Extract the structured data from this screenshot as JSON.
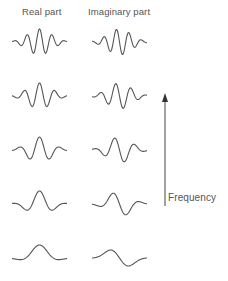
{
  "headers": {
    "real": "Real part",
    "imaginary": "Imaginary part"
  },
  "axis": {
    "label": "Frequency",
    "direction": "up"
  },
  "rows": [
    {
      "center_y": 42,
      "cycles": 2.2,
      "sigma": 0.42
    },
    {
      "center_y": 96,
      "cycles": 1.8,
      "sigma": 0.42
    },
    {
      "center_y": 150,
      "cycles": 1.35,
      "sigma": 0.42
    },
    {
      "center_y": 204,
      "cycles": 0.95,
      "sigma": 0.4
    },
    {
      "center_y": 258,
      "cycles": 0.5,
      "sigma": 0.4
    }
  ],
  "columns": [
    {
      "name": "real",
      "x_start": 12,
      "x_end": 67,
      "phase": "cos"
    },
    {
      "name": "imaginary",
      "x_start": 92,
      "x_end": 147,
      "phase": "sin"
    }
  ],
  "amplitude": 13,
  "colors": {
    "stroke": "#555555",
    "text": "#555555"
  }
}
